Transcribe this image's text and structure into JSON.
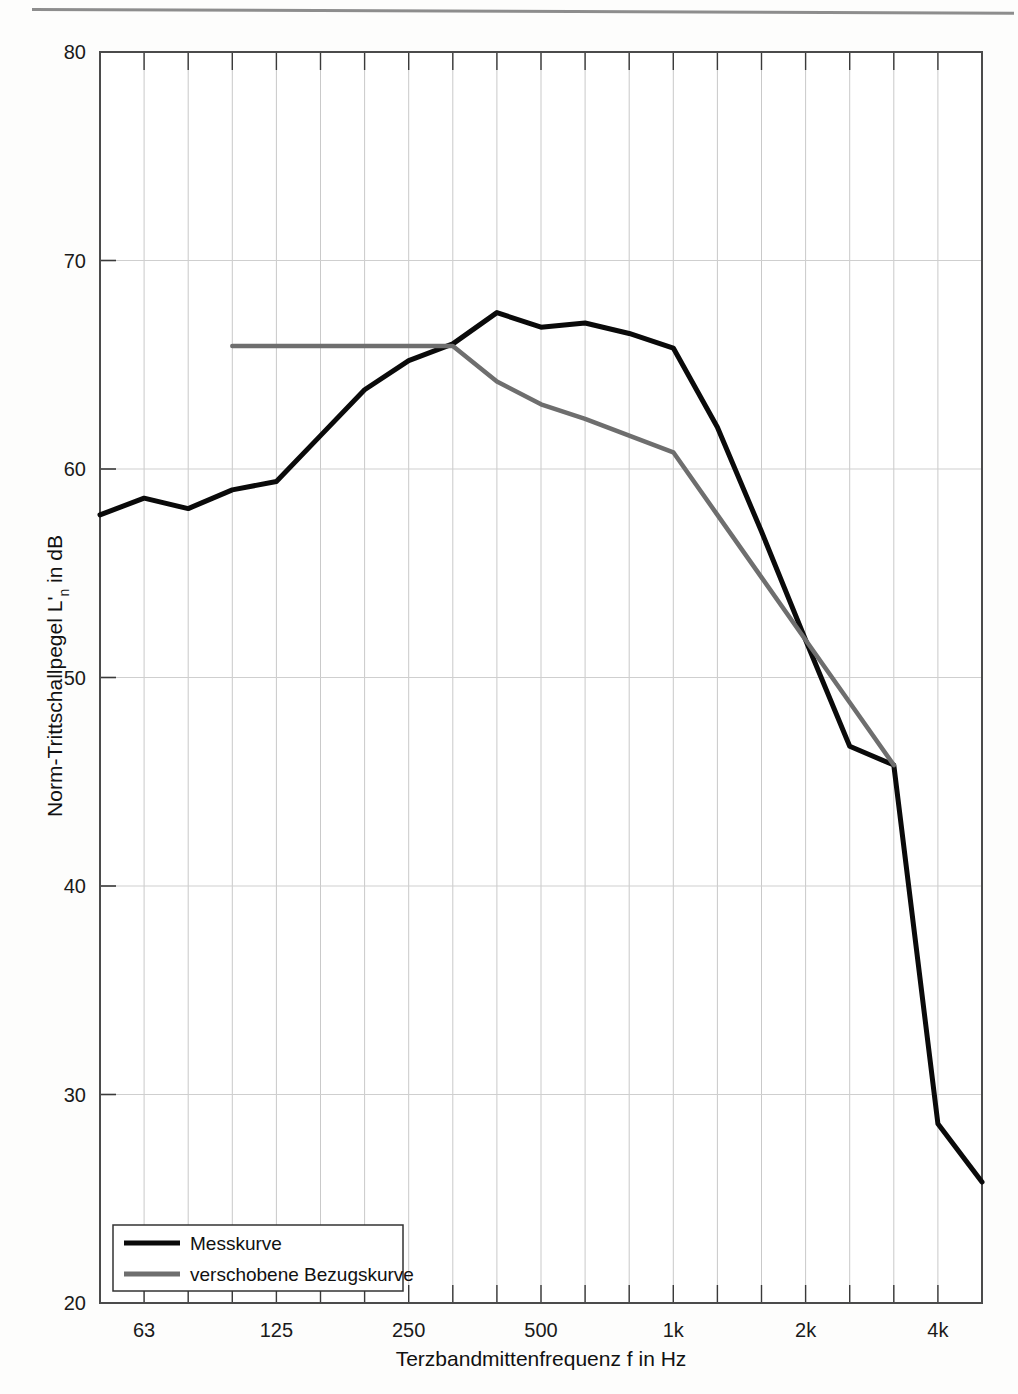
{
  "chart_data": {
    "type": "line",
    "title": "",
    "xlabel": "Terzbandmittenfrequenz f in Hz",
    "ylabel": "Norm-Trittschallpegel L'n in dB",
    "ylabel_main": "Norm-Trittschallpegel L'",
    "ylabel_sub": "n",
    "ylabel_tail": " in dB",
    "x_scale": "log-third-octave",
    "xlim": [
      50,
      5000
    ],
    "ylim": [
      20,
      80
    ],
    "grid": true,
    "legend_position": "bottom-left",
    "x_tick_labels": [
      "63",
      "125",
      "250",
      "500",
      "1k",
      "2k",
      "4k"
    ],
    "x_tick_values": [
      63,
      125,
      250,
      500,
      1000,
      2000,
      4000
    ],
    "y_tick_labels": [
      "20",
      "30",
      "40",
      "50",
      "60",
      "70",
      "80"
    ],
    "y_tick_values": [
      20,
      30,
      40,
      50,
      60,
      70,
      80
    ],
    "x_minor_bands": [
      50,
      63,
      80,
      100,
      125,
      160,
      200,
      250,
      315,
      400,
      500,
      630,
      800,
      1000,
      1250,
      1600,
      2000,
      2500,
      3150,
      4000,
      5000
    ],
    "series": [
      {
        "name": "Messkurve",
        "color": "#0a0a0a",
        "x": [
          50,
          63,
          80,
          100,
          125,
          160,
          200,
          250,
          315,
          400,
          500,
          630,
          800,
          1000,
          1250,
          1600,
          2000,
          2500,
          3150,
          4000,
          5000
        ],
        "values": [
          57.8,
          58.6,
          58.1,
          59.0,
          59.4,
          61.6,
          63.8,
          65.2,
          66.0,
          67.5,
          66.8,
          67.0,
          66.5,
          65.8,
          62.0,
          57.0,
          51.8,
          46.7,
          45.8,
          28.6,
          25.8
        ]
      },
      {
        "name": "verschobene Bezugskurve",
        "color": "#6e6e6e",
        "x": [
          100,
          125,
          160,
          200,
          250,
          315,
          400,
          500,
          630,
          800,
          1000,
          1250,
          1600,
          2000,
          2500,
          3150
        ],
        "values": [
          65.9,
          65.9,
          65.9,
          65.9,
          65.9,
          65.9,
          64.2,
          63.1,
          62.4,
          61.6,
          60.8,
          57.8,
          54.8,
          51.8,
          48.8,
          45.8
        ]
      }
    ],
    "legend": [
      {
        "label": "Messkurve",
        "color": "#0a0a0a"
      },
      {
        "label": "verschobene Bezugskurve",
        "color": "#6e6e6e"
      }
    ]
  },
  "plot_geometry": {
    "left": 100,
    "right": 982,
    "top": 52,
    "bottom": 1303
  }
}
